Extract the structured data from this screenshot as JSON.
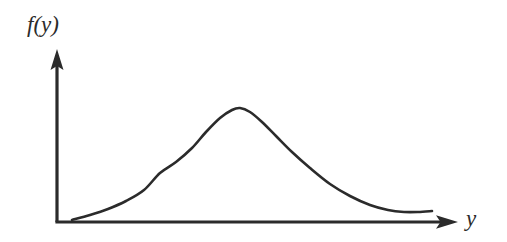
{
  "figure": {
    "background_color": "#ffffff",
    "ink_color": "#2b2b2b",
    "width": 507,
    "height": 242
  },
  "axes": {
    "y_axis": {
      "label": "f(y)",
      "label_name": "density-function-label",
      "arrow": "up-arrow",
      "origin_x": 57,
      "base_y": 222,
      "tip_y": 50
    },
    "x_axis": {
      "label": "y",
      "label_name": "variable-label",
      "arrow": "right-arrow",
      "origin_x": 57,
      "base_y": 222,
      "tip_x": 457
    }
  },
  "chart_data": {
    "type": "line",
    "title": "",
    "subtitle": "",
    "xlabel": "y",
    "ylabel": "f(y)",
    "legend": [],
    "grid": false,
    "axis_ticks": false,
    "tick_labels": [],
    "annotations": [],
    "xlim": [
      57,
      457
    ],
    "ylim": [
      222,
      50
    ],
    "series": [
      {
        "name": "probability-density",
        "stroke": "#2b2b2b",
        "stroke_width": 2.6,
        "x": [
          72,
          90,
          108,
          126,
          144,
          160,
          176,
          192,
          206,
          220,
          232,
          240,
          250,
          262,
          276,
          292,
          310,
          330,
          350,
          370,
          388,
          404,
          418,
          432
        ],
        "y": [
          220,
          215,
          209,
          201,
          190,
          173,
          162,
          148,
          132,
          118,
          110,
          108,
          112,
          122,
          136,
          152,
          168,
          184,
          196,
          205,
          210,
          212,
          212,
          211
        ]
      }
    ]
  }
}
